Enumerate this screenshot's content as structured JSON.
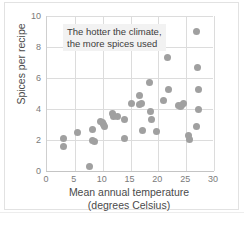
{
  "chart_data": {
    "type": "scatter",
    "title": "",
    "xlabel": "Mean annual temperature",
    "xlabel_line2": "(degrees Celsius)",
    "ylabel": "Spices per recipe",
    "xlim": [
      0,
      30
    ],
    "ylim": [
      0,
      10
    ],
    "xticks": [
      0,
      5,
      10,
      15,
      20,
      25,
      30
    ],
    "yticks": [
      0,
      2,
      4,
      6,
      8,
      10
    ],
    "grid": true,
    "legend": "none",
    "point_color": "#a0a0a0",
    "annotations": [
      {
        "text_line1": "The hotter the climate,",
        "text_line2": "the more spices used",
        "x": 4.5,
        "y": 9.3
      }
    ],
    "points": [
      {
        "x": 2.9,
        "y": 2.1
      },
      {
        "x": 2.9,
        "y": 1.6
      },
      {
        "x": 5.4,
        "y": 2.5
      },
      {
        "x": 7.6,
        "y": 0.3
      },
      {
        "x": 8.2,
        "y": 2.7
      },
      {
        "x": 8.2,
        "y": 2.0
      },
      {
        "x": 8.5,
        "y": 1.9
      },
      {
        "x": 9.6,
        "y": 3.2
      },
      {
        "x": 9.9,
        "y": 3.1
      },
      {
        "x": 10.2,
        "y": 3.0
      },
      {
        "x": 10.4,
        "y": 2.9
      },
      {
        "x": 11.8,
        "y": 3.7
      },
      {
        "x": 11.9,
        "y": 3.5
      },
      {
        "x": 12.6,
        "y": 3.5
      },
      {
        "x": 13.9,
        "y": 3.35
      },
      {
        "x": 14.0,
        "y": 2.1
      },
      {
        "x": 15.1,
        "y": 4.35
      },
      {
        "x": 16.6,
        "y": 4.9
      },
      {
        "x": 16.7,
        "y": 4.3
      },
      {
        "x": 17.0,
        "y": 4.35
      },
      {
        "x": 17.2,
        "y": 2.6
      },
      {
        "x": 18.5,
        "y": 5.7
      },
      {
        "x": 18.6,
        "y": 3.85
      },
      {
        "x": 18.7,
        "y": 3.3
      },
      {
        "x": 19.7,
        "y": 2.55
      },
      {
        "x": 21.0,
        "y": 4.55
      },
      {
        "x": 21.6,
        "y": 7.3
      },
      {
        "x": 21.8,
        "y": 5.25
      },
      {
        "x": 23.6,
        "y": 4.2
      },
      {
        "x": 23.9,
        "y": 4.15
      },
      {
        "x": 24.1,
        "y": 4.2
      },
      {
        "x": 24.5,
        "y": 4.35
      },
      {
        "x": 25.5,
        "y": 2.3
      },
      {
        "x": 25.6,
        "y": 2.05
      },
      {
        "x": 26.9,
        "y": 9.0
      },
      {
        "x": 27.1,
        "y": 6.65
      },
      {
        "x": 27.2,
        "y": 5.25
      },
      {
        "x": 27.3,
        "y": 4.0
      },
      {
        "x": 26.9,
        "y": 2.9
      }
    ]
  }
}
